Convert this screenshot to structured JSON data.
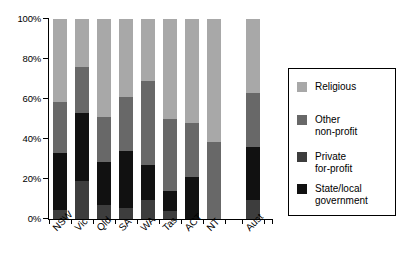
{
  "chart_data": {
    "type": "bar",
    "subtype": "stacked-percentage",
    "title": "",
    "xlabel": "",
    "ylabel": "",
    "ylim": [
      0,
      100
    ],
    "yticks": [
      "0%",
      "20%",
      "40%",
      "60%",
      "80%",
      "100%"
    ],
    "ytick_values": [
      0,
      20,
      40,
      60,
      80,
      100
    ],
    "grid": false,
    "legend_position": "right",
    "categories": [
      "NSW",
      "Vic",
      "Qld",
      "SA",
      "WA",
      "Tas",
      "ACT",
      "NT",
      "Aust"
    ],
    "series": [
      {
        "name": "State/local government",
        "color": "#111111",
        "values": [
          28.5,
          34.0,
          21.5,
          28.5,
          17.5,
          10.0,
          21.0,
          0.0,
          26.5
        ]
      },
      {
        "name": "Private for-profit",
        "color": "#3d3d3d",
        "values": [
          4.5,
          19.0,
          7.0,
          5.5,
          9.5,
          4.0,
          0.0,
          0.0,
          9.5
        ]
      },
      {
        "name": "Other non-profit",
        "color": "#686868",
        "values": [
          25.5,
          23.0,
          22.5,
          27.0,
          42.0,
          36.0,
          27.0,
          38.5,
          27.0
        ]
      },
      {
        "name": "Religious",
        "color": "#a8a8a8",
        "values": [
          41.5,
          24.0,
          49.0,
          39.0,
          31.0,
          50.0,
          52.0,
          61.5,
          37.0
        ]
      }
    ],
    "stack_order_bottom_to_top": [
      "Private for-profit",
      "State/local government",
      "Other non-profit",
      "Religious"
    ],
    "stack_tops_percent": {
      "NSW": {
        "private_for_profit": 4.5,
        "state_local": 33.0,
        "other_non_profit": 58.5,
        "religious": 100
      },
      "Vic": {
        "private_for_profit": 19.0,
        "state_local": 53.0,
        "other_non_profit": 76.0,
        "religious": 100
      },
      "Qld": {
        "private_for_profit": 7.0,
        "state_local": 28.5,
        "other_non_profit": 51.0,
        "religious": 100
      },
      "SA": {
        "private_for_profit": 5.5,
        "state_local": 34.0,
        "other_non_profit": 61.0,
        "religious": 100
      },
      "WA": {
        "private_for_profit": 9.5,
        "state_local": 27.0,
        "other_non_profit": 69.0,
        "religious": 100
      },
      "Tas": {
        "private_for_profit": 4.0,
        "state_local": 14.0,
        "other_non_profit": 50.0,
        "religious": 100
      },
      "ACT": {
        "private_for_profit": 0.0,
        "state_local": 21.0,
        "other_non_profit": 48.0,
        "religious": 100
      },
      "NT": {
        "private_for_profit": 0.0,
        "state_local": 0.0,
        "other_non_profit": 38.5,
        "religious": 100
      },
      "Aust": {
        "private_for_profit": 9.5,
        "state_local": 36.0,
        "other_non_profit": 63.0,
        "religious": 100
      }
    }
  },
  "axis": {
    "yticks": [
      {
        "label": "100%",
        "value": 100
      },
      {
        "label": "80%",
        "value": 80
      },
      {
        "label": "60%",
        "value": 60
      },
      {
        "label": "40%",
        "value": 40
      },
      {
        "label": "20%",
        "value": 20
      },
      {
        "label": "0%",
        "value": 0
      }
    ],
    "xlabels": [
      "NSW",
      "Vic",
      "Qld",
      "SA",
      "WA",
      "Tas",
      "ACT",
      "NT",
      "Aust"
    ]
  },
  "legend": {
    "items": [
      {
        "label": "Religious",
        "color": "#a8a8a8",
        "key": "religious"
      },
      {
        "label": "Other\nnon-profit",
        "color": "#686868",
        "key": "other-non-profit"
      },
      {
        "label": "Private\nfor-profit",
        "color": "#3d3d3d",
        "key": "private-for-profit"
      },
      {
        "label": "State/local\ngovernment",
        "color": "#111111",
        "key": "state-local-government"
      }
    ]
  }
}
